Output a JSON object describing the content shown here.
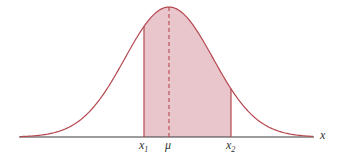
{
  "diagram": {
    "labels": {
      "x_axis": "x",
      "x1": "x",
      "x1_sub": "1",
      "mu": "μ",
      "x2": "x",
      "x2_sub": "2"
    },
    "colors": {
      "curve": "#b5474f",
      "fill": "#e9c6cc",
      "axis": "#3a3a3a",
      "mean_line": "#b5474f"
    },
    "geometry": {
      "baseline_y": 137,
      "axis_x_start": 19,
      "axis_x_end": 314,
      "mu_x": 169,
      "peak_y": 7,
      "sigma_px": 44,
      "x1_px": 144,
      "x2_px": 231
    }
  }
}
